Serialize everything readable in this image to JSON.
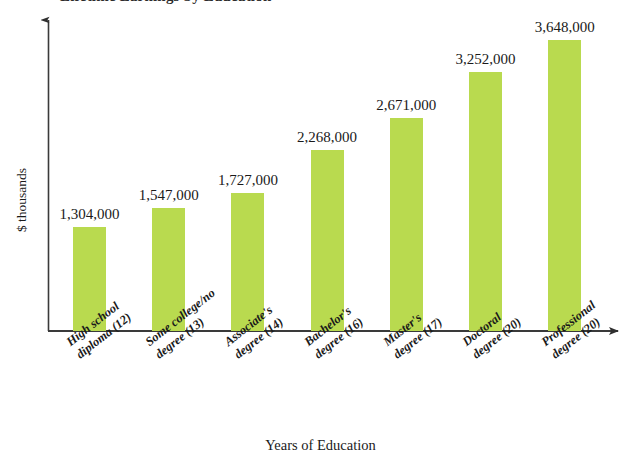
{
  "chart_data": {
    "type": "bar",
    "title": "Lifetime Earnings by Education",
    "xlabel": "Years of Education",
    "ylabel": "$ thousands",
    "grid": false,
    "legend": false,
    "ylim": [
      0,
      4000000
    ],
    "bar_color": "#b9da4f",
    "axis_color": "#3a3a3a",
    "categories": [
      "High school diploma (12)",
      "Some college/no degree (13)",
      "Associate's degree (14)",
      "Bachelor's degree (16)",
      "Master's degree (17)",
      "Doctoral degree (20)",
      "Professional degree (20)"
    ],
    "category_lines": [
      [
        "High school",
        "diploma (12)"
      ],
      [
        "Some college/no",
        "degree (13)"
      ],
      [
        "Associate's",
        "degree (14)"
      ],
      [
        "Bachelor's",
        "degree (16)"
      ],
      [
        "Master's",
        "degree (17)"
      ],
      [
        "Doctoral",
        "degree (20)"
      ],
      [
        "Professional",
        "degree (20)"
      ]
    ],
    "values": [
      1304000,
      1547000,
      1727000,
      2268000,
      2671000,
      3252000,
      3648000
    ],
    "value_labels": [
      "1,304,000",
      "1,547,000",
      "1,727,000",
      "2,268,000",
      "2,671,000",
      "3,252,000",
      "3,648,000"
    ]
  }
}
